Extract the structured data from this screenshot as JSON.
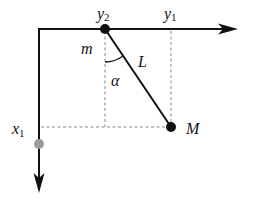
{
  "diagram": {
    "colors": {
      "ink": "#111111",
      "dashed": "#888888",
      "gray_point": "#9a9a9a",
      "background": "#ffffff"
    },
    "labels": {
      "y2": {
        "base": "y",
        "sub": "2"
      },
      "y1": {
        "base": "y",
        "sub": "1"
      },
      "x1": {
        "base": "x",
        "sub": "1"
      },
      "m": "m",
      "L": "L",
      "alpha": "α",
      "M": "M"
    },
    "elements": {
      "horizontal_axis": "y-axis (pointing right)",
      "vertical_axis": "x-axis (pointing down)",
      "pivot_mass": "m",
      "pendulum_rod": "L",
      "bob_mass": "M",
      "angle": "α"
    }
  }
}
